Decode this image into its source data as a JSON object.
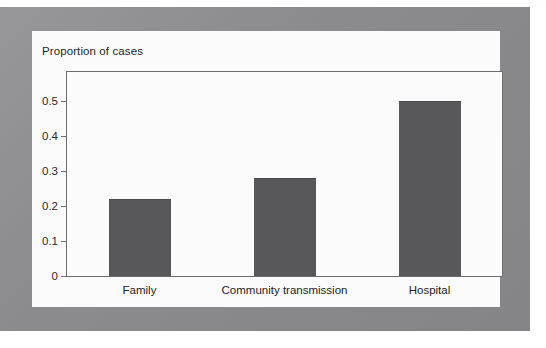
{
  "figure": {
    "title": "Proportion of cases",
    "frame_color": "#8d8d8f",
    "card_color": "#fbfbfb",
    "bar_color": "#58585a",
    "axis_color": "#6e6e70"
  },
  "chart_data": {
    "type": "bar",
    "title": "Proportion of cases",
    "xlabel": "",
    "ylabel": "",
    "categories": [
      "Family",
      "Community transmission",
      "Hospital"
    ],
    "values": [
      0.22,
      0.28,
      0.5
    ],
    "yticks": [
      "0",
      "0.1",
      "0.2",
      "0.3",
      "0.4",
      "0.5"
    ],
    "ytick_values": [
      0,
      0.1,
      0.2,
      0.3,
      0.4,
      0.5
    ],
    "ylim": [
      0,
      0.5833
    ],
    "xlim_note": "categorical",
    "grid": false,
    "legend": null,
    "series": [
      {
        "name": "Proportion of cases",
        "values": [
          0.22,
          0.28,
          0.5
        ]
      }
    ]
  }
}
